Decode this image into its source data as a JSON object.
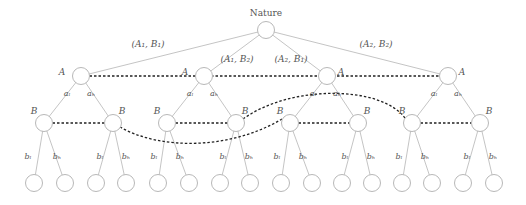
{
  "diagram": {
    "type": "game-tree",
    "root": {
      "label": "Nature",
      "x": 266,
      "y": 30
    },
    "nature_branches": [
      "(A₁, B₁)",
      "(A₁, B₂)",
      "(A₂, B₁)",
      "(A₂, B₂)"
    ],
    "a_nodes": [
      {
        "label": "A",
        "x": 81,
        "y": 76,
        "label_side": "left"
      },
      {
        "label": "A",
        "x": 204,
        "y": 76,
        "label_side": "left"
      },
      {
        "label": "A",
        "x": 327,
        "y": 76,
        "label_side": "right"
      },
      {
        "label": "A",
        "x": 448,
        "y": 76,
        "label_side": "right"
      }
    ],
    "a_actions": [
      "aₗ",
      "aₕ"
    ],
    "b_nodes": [
      {
        "label": "B",
        "x": 44,
        "y": 123
      },
      {
        "label": "B",
        "x": 113,
        "y": 123
      },
      {
        "label": "B",
        "x": 167,
        "y": 123
      },
      {
        "label": "B",
        "x": 236,
        "y": 123
      },
      {
        "label": "B",
        "x": 290,
        "y": 123
      },
      {
        "label": "B",
        "x": 358,
        "y": 123
      },
      {
        "label": "B",
        "x": 412,
        "y": 123
      },
      {
        "label": "B",
        "x": 480,
        "y": 123
      }
    ],
    "b_actions": [
      "bₗ",
      "bₕ"
    ],
    "leaf_count": 16,
    "colors": {
      "edge": "#bdbdbd",
      "node": "#b8b8b8",
      "info_set": "#222222",
      "text": "#555555"
    }
  }
}
